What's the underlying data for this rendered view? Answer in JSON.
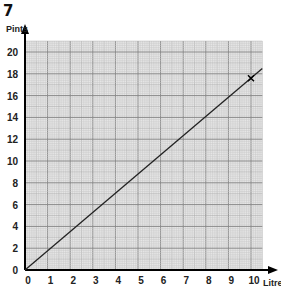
{
  "question_number": "7",
  "chart_data": {
    "type": "line",
    "title": "",
    "xlabel": "Litres",
    "ylabel": "Pints",
    "xlim": [
      0,
      10.5
    ],
    "ylim": [
      0,
      21
    ],
    "x_ticks": [
      0,
      1,
      2,
      3,
      4,
      5,
      6,
      7,
      8,
      9,
      10
    ],
    "y_ticks": [
      0,
      2,
      4,
      6,
      8,
      10,
      12,
      14,
      16,
      18,
      20
    ],
    "grid": true,
    "series": [
      {
        "name": "Litres to pints",
        "x": [
          0,
          10.5
        ],
        "y": [
          0,
          18.48
        ]
      }
    ],
    "annotations": [
      {
        "type": "cross-marker",
        "x": 10,
        "y": 17.6
      }
    ],
    "colors": {
      "line": "#222222",
      "grid_major": "#8a8a8a",
      "grid_minor": "#c8c8c8",
      "grid_bg": "#e6e6e6"
    }
  }
}
